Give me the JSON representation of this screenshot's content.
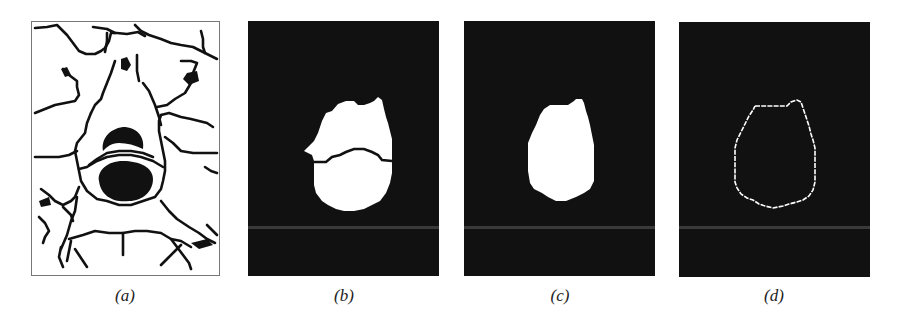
{
  "figure": {
    "panels": [
      {
        "id": "a",
        "label": "(a)",
        "description": "watershed segmentation line map with dark tumor regions",
        "background": "#ffffff",
        "foreground": "#111111"
      },
      {
        "id": "b",
        "label": "(b)",
        "description": "binary mask of merged regions with separating boundary",
        "background": "#111111",
        "foreground": "#ffffff"
      },
      {
        "id": "c",
        "label": "(c)",
        "description": "filled binary mask of merged region",
        "background": "#111111",
        "foreground": "#ffffff"
      },
      {
        "id": "d",
        "label": "(d)",
        "description": "extracted contour of region",
        "background": "#111111",
        "foreground": "#ffffff"
      }
    ]
  }
}
